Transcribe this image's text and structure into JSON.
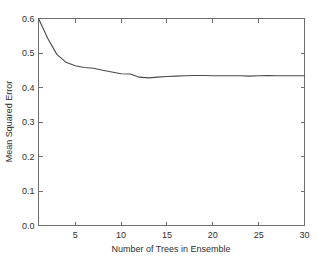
{
  "chart_data": {
    "type": "line",
    "title": "",
    "xlabel": "Number of Trees in Ensemble",
    "ylabel": "Mean Squared Error",
    "xlim": [
      1,
      30
    ],
    "ylim": [
      0.0,
      0.6
    ],
    "grid": false,
    "legend": null,
    "xticks": [
      5,
      10,
      15,
      20,
      25,
      30
    ],
    "xtick_labels": [
      "5",
      "10",
      "15",
      "20",
      "25",
      "30"
    ],
    "yticks": [
      0.0,
      0.1,
      0.2,
      0.3,
      0.4,
      0.5,
      0.6
    ],
    "ytick_labels": [
      "0.0",
      "0.1",
      "0.2",
      "0.3",
      "0.4",
      "0.5",
      "0.6"
    ],
    "series": [
      {
        "name": "Mean Squared Error",
        "color": "#4a4a4a",
        "x": [
          1,
          2,
          3,
          4,
          5,
          6,
          7,
          8,
          9,
          10,
          11,
          12,
          13,
          14,
          15,
          16,
          17,
          18,
          19,
          20,
          21,
          22,
          23,
          24,
          25,
          26,
          27,
          28,
          29,
          30
        ],
        "values": [
          0.6,
          0.543,
          0.496,
          0.473,
          0.463,
          0.458,
          0.456,
          0.45,
          0.445,
          0.44,
          0.439,
          0.43,
          0.428,
          0.43,
          0.432,
          0.433,
          0.434,
          0.435,
          0.435,
          0.434,
          0.434,
          0.434,
          0.434,
          0.433,
          0.434,
          0.435,
          0.434,
          0.434,
          0.434,
          0.434
        ]
      }
    ]
  },
  "axes": {
    "x_label": "Number of Trees in Ensemble",
    "y_label": "Mean Squared Error"
  }
}
